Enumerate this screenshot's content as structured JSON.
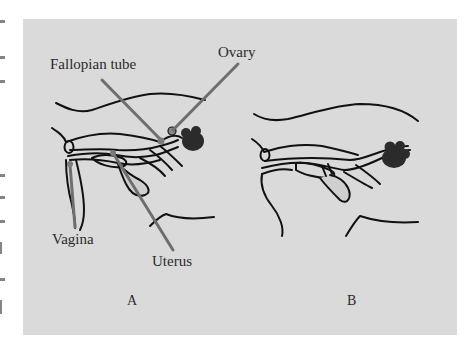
{
  "figure": {
    "panel_color": "#dadada",
    "line_color": "#111111",
    "leader_color": "#6e6e6e",
    "organ_fill": "#2b2b2b",
    "labels": {
      "fallopian_tube": "Fallopian tube",
      "ovary": "Ovary",
      "vagina": "Vagina",
      "uterus": "Uterus"
    },
    "panels": [
      {
        "id": "A",
        "label": "A"
      },
      {
        "id": "B",
        "label": "B"
      }
    ]
  }
}
